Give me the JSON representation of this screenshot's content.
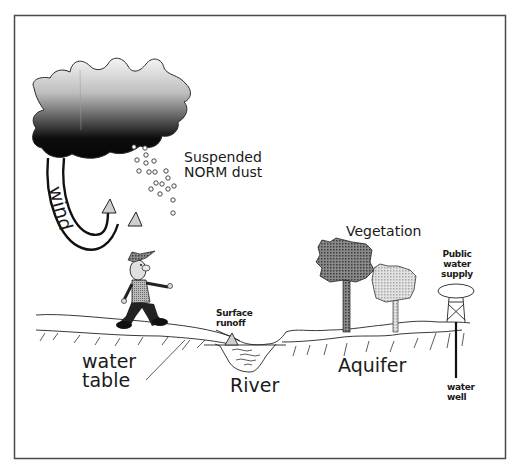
{
  "diagram": {
    "title": "",
    "frame": {
      "border_color": "#4a4a4a",
      "background": "#ffffff"
    },
    "labels": {
      "dust_line1": "Suspended",
      "dust_line2": "NORM dust",
      "wind": "wind",
      "vegetation": "Vegetation",
      "public_supply_line1": "Public",
      "public_supply_line2": "water",
      "public_supply_line3": "supply",
      "surface_runoff_line1": "Surface",
      "surface_runoff_line2": "runoff",
      "water_table_line1": "water",
      "water_table_line2": "table",
      "river": "River",
      "aquifer": "Aquifer",
      "water_well_line1": "water",
      "water_well_line2": "well"
    },
    "elements": [
      {
        "id": "cloud",
        "description": "storm cloud shaded light-to-dark gray"
      },
      {
        "id": "dust-particles",
        "description": "small circles falling from cloud"
      },
      {
        "id": "wind-arrows",
        "description": "two curved arrows from cloud to ground"
      },
      {
        "id": "person",
        "description": "cartoon man walking on ground"
      },
      {
        "id": "ground-surface",
        "description": "land surface line with hatching"
      },
      {
        "id": "river-channel",
        "description": "V-shaped river with water waves"
      },
      {
        "id": "trees",
        "description": "dark tree and light tree"
      },
      {
        "id": "water-tower",
        "description": "public water supply tower"
      },
      {
        "id": "well",
        "description": "vertical water well pipe into aquifer"
      }
    ],
    "colors": {
      "ink": "#1a1a1a",
      "cloud_top": "#f2f2f2",
      "cloud_bottom": "#0a0a0a",
      "tree_dark": "#6e6e6e",
      "tree_light": "#d4d4d4",
      "arrow_fill": "#cfcfcf"
    }
  }
}
